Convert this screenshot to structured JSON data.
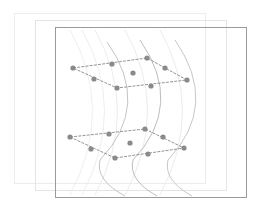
{
  "diagram": {
    "colors": {
      "background": "#ffffff",
      "front_frame": "#9a9a9a",
      "back_frame_1": "#ececec",
      "back_frame_2": "#e4e4e4",
      "wave_faint": "#ececec",
      "wave_main": "#bdbdbd",
      "edge": "#888888",
      "node": "#8a8a8a"
    },
    "frames": [
      {
        "x": 14,
        "y": 13,
        "w": 191,
        "h": 170
      },
      {
        "x": 35,
        "y": 20,
        "w": 191,
        "h": 170
      },
      {
        "x": 55,
        "y": 27,
        "w": 191,
        "h": 170
      }
    ],
    "planes": [
      {
        "name": "upper-plane",
        "corners": [
          [
            73,
            68
          ],
          [
            147,
            58
          ],
          [
            187,
            80
          ],
          [
            117,
            88
          ]
        ],
        "nodes": [
          [
            73,
            68
          ],
          [
            112,
            64
          ],
          [
            147,
            58
          ],
          [
            165,
            68
          ],
          [
            187,
            80
          ],
          [
            151,
            86
          ],
          [
            117,
            88
          ],
          [
            94,
            79
          ],
          [
            133,
            73
          ]
        ]
      },
      {
        "name": "lower-plane",
        "corners": [
          [
            70,
            137
          ],
          [
            145,
            129
          ],
          [
            184,
            148
          ],
          [
            115,
            158
          ]
        ],
        "nodes": [
          [
            70,
            137
          ],
          [
            109,
            134
          ],
          [
            145,
            129
          ],
          [
            163,
            137
          ],
          [
            184,
            148
          ],
          [
            148,
            154
          ],
          [
            115,
            158
          ],
          [
            91,
            149
          ],
          [
            130,
            143
          ]
        ]
      }
    ]
  }
}
